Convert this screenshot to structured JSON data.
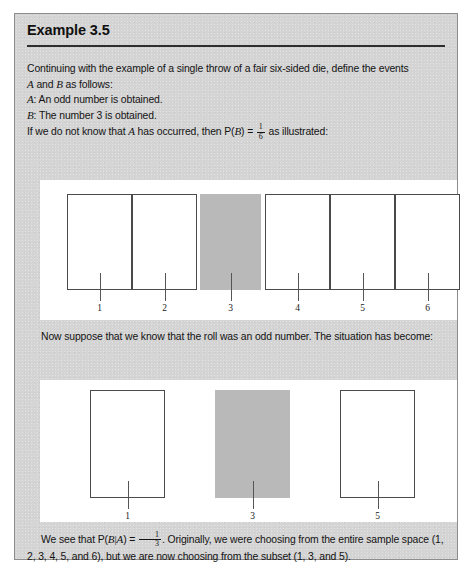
{
  "panel": {
    "title": "Example 3.5",
    "background_color": "#d4d4d4",
    "border_color": "#8d8d8d"
  },
  "intro": {
    "line1_a": "Continuing with the example of a single throw of a fair six-sided die, define the events",
    "line2_a": "A",
    "line2_b": " and ",
    "line2_c": "B",
    "line2_d": " as follows:",
    "line3_label": "A",
    "line3_text": ": An odd number is obtained.",
    "line4_label": "B",
    "line4_text": ": The number 3 is obtained.",
    "line5_a": "If we do not know that ",
    "line5_b": "A",
    "line5_c": " has occurred, then P(",
    "line5_d": "B",
    "line5_e": ") = ",
    "line5_frac_num": "1",
    "line5_frac_den": "6",
    "line5_f": " as illustrated:"
  },
  "middle": {
    "text": "Now suppose that we know that the roll was an odd number. The situation has become:"
  },
  "conclusion": {
    "a": "We see that P(",
    "b": "B",
    "bar": "|",
    "c": "A",
    "d": ") = ",
    "frac_num": "1",
    "frac_den": "3",
    "e": ". Originally, we were choosing from the entire sample space (1, 2, 3, 4, 5, and 6), but we are now choosing from the subset (1, 3, and 5)."
  },
  "figure1": {
    "caption_note": "unconditional sample space of a fair six-sided die",
    "shaded_color": "#b9b9b9",
    "outline_color": "#4a4a4a",
    "cells": [
      {
        "label": "1",
        "shaded": false,
        "x": 27,
        "w": 65
      },
      {
        "label": "2",
        "shaded": false,
        "x": 92,
        "w": 65
      },
      {
        "label": "3",
        "shaded": true,
        "x": 160,
        "w": 61
      },
      {
        "label": "4",
        "shaded": false,
        "x": 225,
        "w": 65
      },
      {
        "label": "5",
        "shaded": false,
        "x": 290,
        "w": 65
      },
      {
        "label": "6",
        "shaded": false,
        "x": 355,
        "w": 65
      }
    ]
  },
  "figure2": {
    "caption_note": "conditional sample space given an odd number",
    "shaded_color": "#b9b9b9",
    "outline_color": "#4a4a4a",
    "cells": [
      {
        "label": "1",
        "shaded": false,
        "x": 50,
        "w": 75
      },
      {
        "label": "3",
        "shaded": true,
        "x": 175,
        "w": 75
      },
      {
        "label": "5",
        "shaded": false,
        "x": 300,
        "w": 75
      }
    ]
  },
  "chart_data": {
    "type": "bar",
    "charts": [
      {
        "name": "unconditional",
        "categories": [
          "1",
          "2",
          "3",
          "4",
          "5",
          "6"
        ],
        "highlighted": [
          "3"
        ],
        "probability": "1/6",
        "note": "P(B) = 1/6"
      },
      {
        "name": "conditional-on-A",
        "categories": [
          "1",
          "3",
          "5"
        ],
        "highlighted": [
          "3"
        ],
        "probability": "1/3",
        "note": "P(B|A) = 1/3"
      }
    ]
  }
}
